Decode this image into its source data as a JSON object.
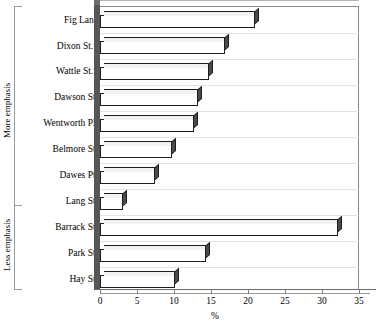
{
  "chart_data": {
    "type": "bar",
    "orientation": "horizontal",
    "title": "",
    "xlabel": "%",
    "ylabel": "",
    "xlim": [
      0,
      35
    ],
    "xticks": [
      0,
      5,
      10,
      15,
      20,
      25,
      30,
      35
    ],
    "xtick_labels": [
      "0",
      "5",
      "10",
      "15",
      "20",
      "25",
      "30",
      "35"
    ],
    "grid": false,
    "legend": false,
    "categories": [
      "Fig Lane",
      "Dixon St.*",
      "Wattle St.*",
      "Dawson St.",
      "Wentworth Pl.",
      "Belmore St.",
      "Dawes Pt.",
      "Lang St.",
      "Barrack St.",
      "Park St.",
      "Hay St."
    ],
    "values": [
      21.0,
      16.9,
      14.7,
      13.2,
      12.7,
      9.7,
      7.4,
      3.1,
      32.2,
      14.3,
      10.1
    ],
    "groups": [
      {
        "label": "More emphasis",
        "categories": [
          "Fig Lane",
          "Dixon St.*",
          "Wattle St.*",
          "Dawson St.",
          "Wentworth Pl.",
          "Belmore St.",
          "Dawes Pt.",
          "Lang St."
        ]
      },
      {
        "label": "Less emphasis",
        "categories": [
          "Barrack St.",
          "Park St.",
          "Hay St."
        ]
      }
    ],
    "series": [
      {
        "name": "%",
        "values": [
          21.0,
          16.9,
          14.7,
          13.2,
          12.7,
          9.7,
          7.4,
          3.1,
          32.2,
          14.3,
          10.1
        ]
      }
    ],
    "style": {
      "bar_face": "#ffffff",
      "bar_edge": "#1d1d1d",
      "bar_shadow": "#4a4a4a",
      "wall": "#575757",
      "axis": "#8a8a8a"
    }
  }
}
